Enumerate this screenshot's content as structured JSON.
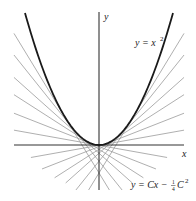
{
  "figure": {
    "axis_labels": {
      "x": "x",
      "y": "y"
    },
    "curve_label": {
      "lhs": "y = x",
      "exp": "2"
    },
    "family_label": {
      "lhs": "y = Cx − ",
      "frac_num": "1",
      "frac_den": "4",
      "var": "C",
      "exp": "2"
    },
    "colors": {
      "axis": "#333333",
      "curve": "#1a1a1a",
      "tangent": "#9a9a9a",
      "text": "#222222"
    }
  },
  "geometry": {
    "origin_px": [
      99,
      145
    ],
    "x_scale_px": 74,
    "y_scale_px": 132,
    "x_axis_px": [
      14,
      184
    ],
    "y_axis_px": [
      12,
      190
    ],
    "curve_u_range": [
      -1.0,
      1.0
    ]
  },
  "tangent_points_a": [
    -0.46,
    -0.35,
    -0.25,
    -0.18,
    -0.11,
    -0.05,
    0.05,
    0.11,
    0.18,
    0.25,
    0.35,
    0.46
  ],
  "tangent_inner_u": [
    0.25,
    0.33,
    0.45,
    0.6,
    0.77,
    0.92
  ],
  "outer_u": 1.149
}
